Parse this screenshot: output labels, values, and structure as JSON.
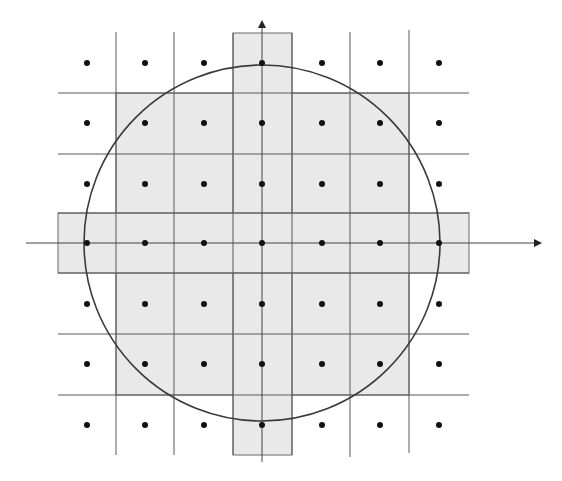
{
  "canvas": {
    "width": 562,
    "height": 481,
    "background": "#ffffff"
  },
  "colors": {
    "shade": "#e9e9e9",
    "shade_stroke": "#6a6a6a",
    "grid": "#5a5a5a",
    "circle": "#3a3a3a",
    "axis": "#444444",
    "dot": "#111111"
  },
  "diagram": {
    "circle": {
      "cx": 262,
      "cy": 243,
      "r": 178
    },
    "shaded_regions": [
      {
        "name": "central-block",
        "x": 116,
        "y": 93,
        "w": 293,
        "h": 302
      },
      {
        "name": "vertical-strip",
        "x": 233,
        "y": 33,
        "w": 59,
        "h": 422
      },
      {
        "name": "horizontal-strip",
        "x": 58,
        "y": 213,
        "w": 411,
        "h": 60
      }
    ],
    "vertical_grid_lines": [
      {
        "x": 116,
        "y1": 32,
        "y2": 455
      },
      {
        "x": 174,
        "y1": 32,
        "y2": 455
      },
      {
        "x": 233,
        "y1": 33,
        "y2": 455
      },
      {
        "x": 292,
        "y1": 33,
        "y2": 455
      },
      {
        "x": 350,
        "y1": 32,
        "y2": 457
      },
      {
        "x": 409,
        "y1": 30,
        "y2": 453
      }
    ],
    "horizontal_grid_lines": [
      {
        "y": 93,
        "x1": 58,
        "x2": 469
      },
      {
        "y": 154,
        "x1": 58,
        "x2": 469
      },
      {
        "y": 213,
        "x1": 58,
        "x2": 469
      },
      {
        "y": 273,
        "x1": 58,
        "x2": 469
      },
      {
        "y": 334,
        "x1": 58,
        "x2": 469
      },
      {
        "y": 395,
        "x1": 58,
        "x2": 469
      }
    ],
    "axes": {
      "x_axis": {
        "y": 243,
        "x1": 26,
        "x2": 540,
        "arrow": "right"
      },
      "y_axis": {
        "x": 262,
        "y1": 462,
        "y2": 22,
        "arrow": "up"
      }
    },
    "dot_radius": 3,
    "dot_columns": [
      87,
      145,
      204,
      262,
      322,
      380,
      439
    ],
    "dot_rows": [
      63,
      123,
      184,
      243,
      304,
      364,
      425
    ]
  }
}
